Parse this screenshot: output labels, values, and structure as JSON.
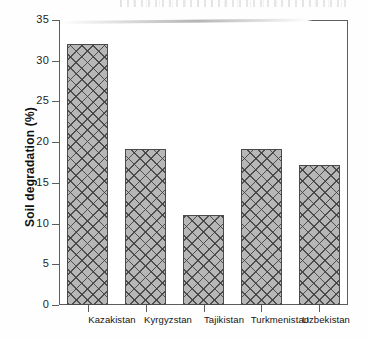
{
  "figure": {
    "kind": "scanned-bar-chart",
    "background_color": "#ffffff",
    "frame_color": "#5d5d5d",
    "bar_fill_color": "#b7b7b7",
    "bar_outline_color": "#4a4a4a",
    "bar_pattern": "crosshatch"
  },
  "chart_data": {
    "type": "bar",
    "title": "",
    "xlabel": "",
    "ylabel": "Soil degradation (%)",
    "categories": [
      "Kazakistan",
      "Kyrgyzstan",
      "Tajikistan",
      "Turkmenistan",
      "Uzbekistan"
    ],
    "values": [
      32.0,
      19.2,
      11.0,
      19.2,
      17.2
    ],
    "ylim": [
      0,
      35
    ],
    "yticks": [
      0,
      5,
      10,
      15,
      20,
      25,
      30,
      35
    ],
    "ytick_labels": [
      "0",
      "5",
      "10",
      "15",
      "20",
      "25",
      "30",
      "35"
    ],
    "grid": false,
    "legend": null,
    "legend_position": "none",
    "tick_direction": "out",
    "frame": "box"
  }
}
